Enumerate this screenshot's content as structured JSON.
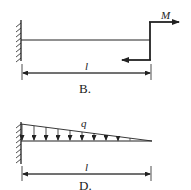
{
  "figure_b": {
    "caption": "B.",
    "moment_label": "M",
    "length_label": "l"
  },
  "figure_d": {
    "caption": "D.",
    "load_label": "q",
    "length_label": "l"
  },
  "colors": {
    "ink": "#222222",
    "background": "#ffffff"
  }
}
